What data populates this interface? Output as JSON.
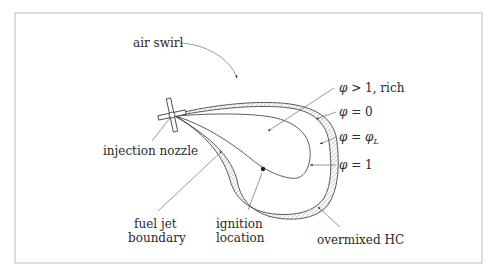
{
  "diagram": {
    "type": "spray combustion mixing schematic",
    "labels": {
      "air_swirl": "air swirl",
      "injection_nozzle": "injection nozzle",
      "fuel_jet_line1": "fuel jet",
      "fuel_jet_line2": "boundary",
      "ignition_line1": "ignition",
      "ignition_line2": "location",
      "overmixed": "overmixed HC",
      "phi_rich_sym": "φ",
      "phi_rich_rest": " > 1, rich",
      "phi_zero_sym": "φ",
      "phi_zero_rest": " = 0",
      "phi_L_sym": "φ",
      "phi_L_eq": " = ",
      "phi_L_sym2": "φ",
      "phi_L_sub": "L",
      "phi_one_sym": "φ",
      "phi_one_rest": " = 1"
    },
    "colors": {
      "line": "#333333",
      "frame": "#bbbbbb",
      "hatch": "#666666",
      "text": "#2a2a2a"
    }
  }
}
